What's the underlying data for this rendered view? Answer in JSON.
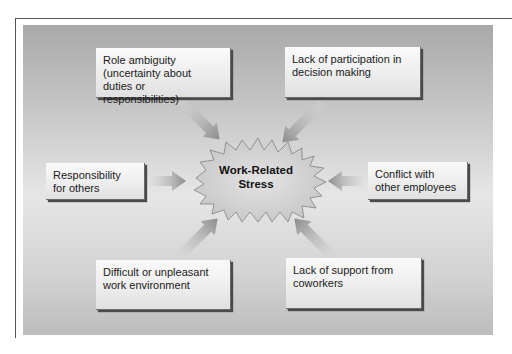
{
  "diagram": {
    "center": {
      "line1": "Work-Related",
      "line2": "Stress"
    },
    "causes": [
      {
        "id": "role-ambiguity",
        "lines": [
          "Role ambiguity",
          "(uncertainty about",
          "duties or responsibilities)"
        ]
      },
      {
        "id": "lack-of-participation",
        "lines": [
          "Lack of participation in",
          "decision making"
        ]
      },
      {
        "id": "responsibility-for-others",
        "lines": [
          "Responsibility",
          "for others"
        ]
      },
      {
        "id": "conflict-with-employees",
        "lines": [
          "Conflict with",
          "other employees"
        ]
      },
      {
        "id": "difficult-environment",
        "lines": [
          "Difficult or unpleasant",
          "work environment"
        ]
      },
      {
        "id": "lack-of-support",
        "lines": [
          "Lack of support from",
          "coworkers"
        ]
      }
    ],
    "colors": {
      "panel": "#c8c8c8",
      "box": "#f0f0f0",
      "arrow": "#a0a0a0",
      "burst": "#d6d6d6"
    }
  }
}
